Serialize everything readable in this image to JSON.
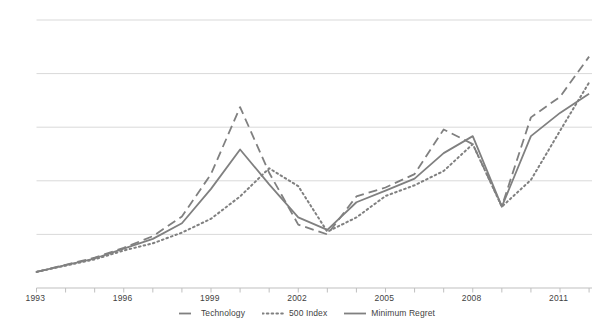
{
  "chart_data": {
    "type": "line",
    "title": "",
    "subtitle": "",
    "xlabel": "",
    "ylabel": "",
    "grid": true,
    "gridlines_y": 5,
    "legend_position": "bottom",
    "xlim": [
      1993,
      2012.1
    ],
    "ylim": [
      0,
      6
    ],
    "xticks_labeled": [
      "1993",
      "1996",
      "1999",
      "2002",
      "2005",
      "2008",
      "2011"
    ],
    "xtick_years_labeled": [
      1993,
      1996,
      1999,
      2002,
      2005,
      2008,
      2011
    ],
    "xtick_years_all": [
      1993,
      1994,
      1995,
      1996,
      1997,
      1998,
      1999,
      2000,
      2001,
      2002,
      2003,
      2004,
      2005,
      2006,
      2007,
      2008,
      2009,
      2010,
      2011,
      2012
    ],
    "yticks": [],
    "x": [
      1993,
      1994,
      1995,
      1996,
      1997,
      1998,
      1999,
      2000,
      2001,
      2002,
      2003,
      2004,
      2005,
      2006,
      2007,
      2008,
      2009,
      2010,
      2011,
      2012
    ],
    "series": [
      {
        "name": "Technology",
        "style": "dashed",
        "color": "#808080",
        "values": [
          0.36,
          0.52,
          0.68,
          0.9,
          1.16,
          1.6,
          2.55,
          4.05,
          2.58,
          1.42,
          1.2,
          2.05,
          2.25,
          2.55,
          3.55,
          3.22,
          1.83,
          3.82,
          4.28,
          5.18
        ]
      },
      {
        "name": "500 Index",
        "style": "dotted",
        "color": "#808080",
        "values": [
          0.36,
          0.5,
          0.64,
          0.84,
          1.0,
          1.24,
          1.55,
          2.05,
          2.68,
          2.28,
          1.26,
          1.58,
          2.06,
          2.3,
          2.62,
          3.22,
          1.82,
          2.42,
          3.52,
          4.6
        ]
      },
      {
        "name": "Minimum Regret",
        "style": "solid",
        "color": "#808080",
        "values": [
          0.36,
          0.51,
          0.66,
          0.88,
          1.1,
          1.45,
          2.22,
          3.1,
          2.32,
          1.58,
          1.3,
          1.92,
          2.18,
          2.45,
          3.02,
          3.4,
          1.82,
          3.4,
          3.92,
          4.35
        ]
      }
    ]
  },
  "axis": {
    "tick_labels": [
      {
        "text": "1993",
        "year": 1993
      },
      {
        "text": "1996",
        "year": 1996
      },
      {
        "text": "1999",
        "year": 1999
      },
      {
        "text": "2002",
        "year": 2002
      },
      {
        "text": "2005",
        "year": 2005
      },
      {
        "text": "2008",
        "year": 2008
      },
      {
        "text": "2011",
        "year": 2011
      }
    ]
  },
  "legend": {
    "items": [
      {
        "label": "Technology",
        "style": "dashed"
      },
      {
        "label": "500 Index",
        "style": "dotted"
      },
      {
        "label": "Minimum Regret",
        "style": "solid"
      }
    ]
  },
  "colors": {
    "line": "#808080",
    "gridline": "#d9d9d9",
    "axis": "#bfbfbf",
    "text": "#3f3f3f",
    "background": "#ffffff"
  }
}
